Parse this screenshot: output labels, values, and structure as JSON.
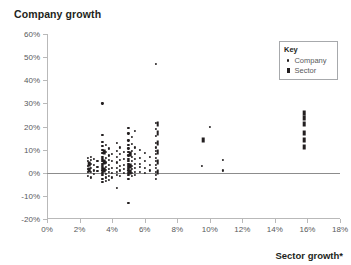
{
  "chart_data": {
    "type": "scatter",
    "title": "Company growth",
    "xlabel": "Sector growth*",
    "ylabel": "Company growth",
    "xlim": [
      0,
      18
    ],
    "ylim": [
      -20,
      60
    ],
    "xticks": [
      "0%",
      "2%",
      "4%",
      "6%",
      "8%",
      "10%",
      "12%",
      "14%",
      "16%",
      "18%"
    ],
    "xtick_values": [
      0,
      2,
      4,
      6,
      8,
      10,
      12,
      14,
      16,
      18
    ],
    "yticks": [
      "60%",
      "50%",
      "40%",
      "30%",
      "20%",
      "10%",
      "0%",
      "-10%",
      "-20%"
    ],
    "ytick_values": [
      60,
      50,
      40,
      30,
      20,
      10,
      0,
      -10,
      -20
    ],
    "grid": false,
    "zero_reference_line": 0,
    "legend_position": "top-right",
    "legend_title": "Key",
    "series": [
      {
        "name": "Company",
        "marker": "dot",
        "color": "#231f20",
        "points": [
          [
            2.5,
            6.5
          ],
          [
            2.5,
            5.0
          ],
          [
            2.5,
            3.0
          ],
          [
            2.5,
            1.5
          ],
          [
            2.5,
            0.3
          ],
          [
            2.5,
            -1.5
          ],
          [
            2.7,
            7.0
          ],
          [
            2.7,
            5.5
          ],
          [
            2.7,
            4.0
          ],
          [
            2.7,
            2.0
          ],
          [
            2.7,
            0.5
          ],
          [
            2.7,
            -2.0
          ],
          [
            2.9,
            6.0
          ],
          [
            2.9,
            3.5
          ],
          [
            2.9,
            1.0
          ],
          [
            2.9,
            -0.5
          ],
          [
            3.1,
            5.0
          ],
          [
            3.1,
            2.5
          ],
          [
            3.1,
            0.8
          ],
          [
            3.4,
            30.0
          ],
          [
            3.4,
            16.5
          ],
          [
            3.4,
            13.5
          ],
          [
            3.4,
            11.5
          ],
          [
            3.4,
            10.0
          ],
          [
            3.4,
            8.5
          ],
          [
            3.4,
            7.0
          ],
          [
            3.4,
            6.0
          ],
          [
            3.4,
            5.0
          ],
          [
            3.4,
            4.0
          ],
          [
            3.4,
            3.0
          ],
          [
            3.4,
            2.0
          ],
          [
            3.4,
            1.0
          ],
          [
            3.4,
            0.0
          ],
          [
            3.4,
            -1.0
          ],
          [
            3.4,
            -2.5
          ],
          [
            3.4,
            -4.0
          ],
          [
            3.6,
            12.0
          ],
          [
            3.6,
            9.0
          ],
          [
            3.6,
            6.5
          ],
          [
            3.6,
            4.5
          ],
          [
            3.6,
            2.5
          ],
          [
            3.6,
            1.2
          ],
          [
            3.6,
            -0.5
          ],
          [
            3.6,
            -2.0
          ],
          [
            3.6,
            -3.5
          ],
          [
            3.8,
            10.5
          ],
          [
            3.8,
            7.5
          ],
          [
            3.8,
            5.5
          ],
          [
            3.8,
            3.5
          ],
          [
            3.8,
            1.5
          ],
          [
            3.8,
            0.2
          ],
          [
            3.8,
            -1.5
          ],
          [
            3.8,
            -3.0
          ],
          [
            4.0,
            8.0
          ],
          [
            4.0,
            5.0
          ],
          [
            4.0,
            2.0
          ],
          [
            4.0,
            0.0
          ],
          [
            4.0,
            -2.0
          ],
          [
            4.3,
            13.0
          ],
          [
            4.3,
            9.5
          ],
          [
            4.3,
            7.0
          ],
          [
            4.3,
            4.5
          ],
          [
            4.3,
            2.0
          ],
          [
            4.3,
            0.5
          ],
          [
            4.3,
            -1.0
          ],
          [
            4.3,
            -6.5
          ],
          [
            4.5,
            11.0
          ],
          [
            4.5,
            8.0
          ],
          [
            4.5,
            5.5
          ],
          [
            4.5,
            3.0
          ],
          [
            4.5,
            1.0
          ],
          [
            4.5,
            -1.5
          ],
          [
            4.7,
            9.0
          ],
          [
            4.7,
            6.0
          ],
          [
            4.7,
            3.5
          ],
          [
            4.7,
            1.5
          ],
          [
            4.7,
            0.0
          ],
          [
            5.0,
            -13.0
          ],
          [
            5.0,
            19.5
          ],
          [
            5.0,
            17.0
          ],
          [
            5.0,
            14.0
          ],
          [
            5.0,
            12.0
          ],
          [
            5.0,
            10.5
          ],
          [
            5.0,
            9.0
          ],
          [
            5.0,
            7.5
          ],
          [
            5.0,
            6.0
          ],
          [
            5.0,
            5.0
          ],
          [
            5.0,
            4.0
          ],
          [
            5.0,
            3.0
          ],
          [
            5.0,
            2.0
          ],
          [
            5.0,
            1.0
          ],
          [
            5.0,
            0.0
          ],
          [
            5.0,
            -1.0
          ],
          [
            5.0,
            -2.5
          ],
          [
            5.2,
            15.5
          ],
          [
            5.2,
            12.5
          ],
          [
            5.2,
            9.5
          ],
          [
            5.2,
            7.0
          ],
          [
            5.2,
            5.0
          ],
          [
            5.2,
            3.0
          ],
          [
            5.2,
            1.5
          ],
          [
            5.2,
            0.0
          ],
          [
            5.2,
            -1.5
          ],
          [
            5.4,
            18.0
          ],
          [
            5.4,
            11.0
          ],
          [
            5.4,
            8.0
          ],
          [
            5.4,
            6.0
          ],
          [
            5.4,
            4.0
          ],
          [
            5.4,
            2.0
          ],
          [
            5.4,
            0.5
          ],
          [
            5.4,
            -1.0
          ],
          [
            5.7,
            10.0
          ],
          [
            5.7,
            6.5
          ],
          [
            5.7,
            4.0
          ],
          [
            5.7,
            2.5
          ],
          [
            5.7,
            0.5
          ],
          [
            6.0,
            8.5
          ],
          [
            6.0,
            5.0
          ],
          [
            6.0,
            2.0
          ],
          [
            6.0,
            0.0
          ],
          [
            6.3,
            7.0
          ],
          [
            6.3,
            3.5
          ],
          [
            6.3,
            1.0
          ],
          [
            6.7,
            47.0
          ],
          [
            6.7,
            21.5
          ],
          [
            6.7,
            19.0
          ],
          [
            6.7,
            16.0
          ],
          [
            6.7,
            13.0
          ],
          [
            6.7,
            11.0
          ],
          [
            6.7,
            9.5
          ],
          [
            6.7,
            8.0
          ],
          [
            6.7,
            6.5
          ],
          [
            6.7,
            5.0
          ],
          [
            6.7,
            3.5
          ],
          [
            6.7,
            2.0
          ],
          [
            6.7,
            0.5
          ],
          [
            6.7,
            -1.0
          ],
          [
            6.7,
            -2.5
          ],
          [
            9.5,
            3.0
          ],
          [
            10.0,
            20.0
          ],
          [
            10.8,
            5.5
          ],
          [
            10.8,
            1.0
          ]
        ]
      },
      {
        "name": "Sector",
        "marker": "bar",
        "color": "#231f20",
        "points": [
          [
            2.6,
            4.0
          ],
          [
            2.6,
            1.0
          ],
          [
            3.5,
            9.0
          ],
          [
            3.5,
            4.5
          ],
          [
            3.5,
            1.0
          ],
          [
            5.1,
            8.0
          ],
          [
            5.1,
            3.0
          ],
          [
            5.1,
            0.5
          ],
          [
            6.8,
            21.0
          ],
          [
            6.8,
            17.0
          ],
          [
            6.8,
            13.0
          ],
          [
            6.8,
            9.0
          ],
          [
            6.8,
            4.5
          ],
          [
            6.8,
            0.5
          ],
          [
            9.6,
            14.0
          ],
          [
            15.8,
            26.0
          ],
          [
            15.8,
            23.5
          ],
          [
            15.8,
            21.0
          ],
          [
            15.8,
            17.0
          ],
          [
            15.8,
            14.0
          ],
          [
            15.8,
            11.0
          ]
        ]
      }
    ]
  },
  "legend": {
    "title": "Key",
    "entries": [
      {
        "label": "Company",
        "marker": "dot"
      },
      {
        "label": "Sector",
        "marker": "bar"
      }
    ]
  }
}
